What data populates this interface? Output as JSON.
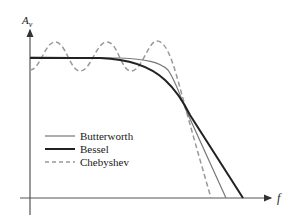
{
  "diagram": {
    "type": "filter-frequency-response",
    "y_axis_label": "A",
    "y_axis_subscript": "v",
    "x_axis_label": "f",
    "legend": [
      {
        "name": "Butterworth",
        "style": "thin-solid",
        "color": "#777777"
      },
      {
        "name": "Bessel",
        "style": "thick-solid",
        "color": "#222222"
      },
      {
        "name": "Chebyshev",
        "style": "dashed",
        "color": "#999999"
      }
    ],
    "curves": {
      "butterworth": "flat passband, sharp knee, steep rolloff",
      "bessel": "flat passband, gradual rolloff",
      "chebyshev": "rippled passband, steepest rolloff"
    }
  }
}
